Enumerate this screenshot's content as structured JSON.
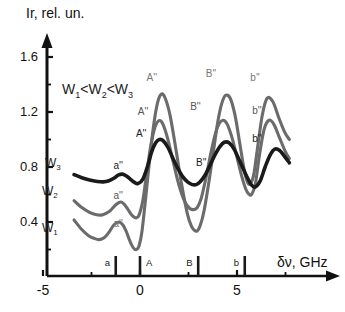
{
  "figure": {
    "ylabel": "Ir, rel. un.",
    "xlabel": "δν, GHz",
    "annotation": {
      "w1": "W",
      "s1": "1",
      "lt1": "<",
      "w2": "W",
      "s2": "2",
      "lt2": "<",
      "w3": "W",
      "s3": "3"
    }
  },
  "axes": {
    "yticks": [
      "0.4",
      "0.8",
      "1.2",
      "1.6"
    ],
    "xticks": [
      "-5",
      "0",
      "5"
    ]
  },
  "curve_labels": [
    {
      "name": "W",
      "sub": "3"
    },
    {
      "name": "W",
      "sub": "2"
    },
    {
      "name": "W",
      "sub": "1"
    }
  ],
  "stick_markers": [
    {
      "label": "a",
      "x": -1.25
    },
    {
      "label": "A",
      "x": 0.0
    },
    {
      "label": "B",
      "x": 3.0
    },
    {
      "label": "b",
      "x": 5.4
    }
  ],
  "peak_labels": [
    {
      "text": "a''",
      "series": "W3",
      "x": -0.95,
      "y": 0.8
    },
    {
      "text": "a''",
      "series": "W2",
      "x": -0.95,
      "y": 0.58
    },
    {
      "text": "a''",
      "series": "W1",
      "x": -0.95,
      "y": 0.38
    },
    {
      "text": "A''",
      "series": "W1",
      "x": 0.75,
      "y": 1.44
    },
    {
      "text": "A''",
      "series": "W2",
      "x": 0.3,
      "y": 1.19
    },
    {
      "text": "A''",
      "series": "W3",
      "x": 0.2,
      "y": 1.03
    },
    {
      "text": "B''",
      "series": "W1",
      "x": 3.8,
      "y": 1.47
    },
    {
      "text": "B''",
      "series": "W2",
      "x": 3.0,
      "y": 1.23
    },
    {
      "text": "B''",
      "series": "W3",
      "x": 3.3,
      "y": 0.82
    },
    {
      "text": "b''",
      "series": "W1",
      "x": 6.1,
      "y": 1.44
    },
    {
      "text": "b''",
      "series": "W2",
      "x": 6.2,
      "y": 1.2
    },
    {
      "text": "b''",
      "series": "W3",
      "x": 6.2,
      "y": 1.0
    }
  ],
  "chart_data": {
    "type": "line",
    "title": "",
    "xlabel": "δν, GHz",
    "ylabel": "Ir, rel. un.",
    "xlim": [
      -5,
      8
    ],
    "ylim": [
      0,
      1.7
    ],
    "yticks": [
      0.4,
      0.8,
      1.2,
      1.6
    ],
    "xticks": [
      -5,
      0,
      5
    ],
    "grid": false,
    "legend": "inline-curve-labels",
    "annotations": [
      "W1<W2<W3"
    ],
    "colors": {
      "W3": "#1a1a1a",
      "W2": "#6b6b6b",
      "W1": "#6b6b6b"
    },
    "series": [
      {
        "name": "W3",
        "color": "#1a1a1a",
        "x": [
          -3.4,
          -3.0,
          -2.6,
          -2.2,
          -1.9,
          -1.6,
          -1.35,
          -1.1,
          -0.9,
          -0.7,
          -0.5,
          -0.3,
          -0.1,
          0.15,
          0.4,
          0.6,
          0.8,
          1.0,
          1.2,
          1.45,
          1.7,
          1.95,
          2.2,
          2.45,
          2.7,
          2.9,
          3.1,
          3.35,
          3.6,
          3.85,
          4.1,
          4.35,
          4.6,
          4.85,
          5.1,
          5.35,
          5.55,
          5.75,
          5.95,
          6.2,
          6.45,
          6.7,
          6.95,
          7.2,
          7.45,
          7.7
        ],
        "y": [
          0.745,
          0.722,
          0.705,
          0.695,
          0.692,
          0.7,
          0.718,
          0.742,
          0.748,
          0.735,
          0.712,
          0.69,
          0.68,
          0.712,
          0.81,
          0.91,
          0.975,
          1.0,
          0.99,
          0.94,
          0.862,
          0.79,
          0.73,
          0.692,
          0.672,
          0.672,
          0.692,
          0.74,
          0.81,
          0.885,
          0.945,
          0.98,
          0.975,
          0.93,
          0.855,
          0.778,
          0.718,
          0.668,
          0.655,
          0.7,
          0.8,
          0.885,
          0.93,
          0.92,
          0.878,
          0.83
        ]
      },
      {
        "name": "W2",
        "color": "#6b6b6b",
        "x": [
          -3.4,
          -3.0,
          -2.6,
          -2.3,
          -2.0,
          -1.75,
          -1.5,
          -1.25,
          -1.0,
          -0.82,
          -0.65,
          -0.5,
          -0.35,
          -0.2,
          -0.05,
          0.15,
          0.35,
          0.55,
          0.75,
          0.95,
          1.15,
          1.4,
          1.7,
          2.0,
          2.3,
          2.55,
          2.75,
          2.95,
          3.15,
          3.4,
          3.65,
          3.9,
          4.1,
          4.3,
          4.5,
          4.75,
          5.0,
          5.25,
          5.45,
          5.6,
          5.75,
          5.95,
          6.15,
          6.4,
          6.65,
          6.9,
          7.2,
          7.5,
          7.7
        ],
        "y": [
          0.555,
          0.505,
          0.47,
          0.455,
          0.45,
          0.462,
          0.487,
          0.525,
          0.545,
          0.53,
          0.498,
          0.465,
          0.44,
          0.43,
          0.45,
          0.56,
          0.76,
          0.95,
          1.08,
          1.135,
          1.12,
          1.02,
          0.845,
          0.672,
          0.55,
          0.5,
          0.49,
          0.505,
          0.57,
          0.72,
          0.9,
          1.05,
          1.12,
          1.14,
          1.11,
          1.01,
          0.87,
          0.73,
          0.64,
          0.605,
          0.6,
          0.68,
          0.88,
          1.075,
          1.14,
          1.11,
          1.01,
          0.91,
          0.862
        ]
      },
      {
        "name": "W1",
        "color": "#6b6b6b",
        "x": [
          -3.4,
          -3.0,
          -2.65,
          -2.35,
          -2.1,
          -1.85,
          -1.6,
          -1.35,
          -1.1,
          -0.9,
          -0.72,
          -0.55,
          -0.42,
          -0.3,
          -0.18,
          -0.05,
          0.1,
          0.3,
          0.5,
          0.7,
          0.9,
          1.1,
          1.3,
          1.55,
          1.85,
          2.15,
          2.45,
          2.65,
          2.8,
          2.95,
          3.1,
          3.3,
          3.55,
          3.8,
          4.0,
          4.2,
          4.4,
          4.65,
          4.9,
          5.15,
          5.35,
          5.5,
          5.65,
          5.85,
          6.05,
          6.3,
          6.55,
          6.85,
          7.15,
          7.45,
          7.7
        ],
        "y": [
          0.415,
          0.345,
          0.3,
          0.28,
          0.272,
          0.285,
          0.325,
          0.378,
          0.4,
          0.382,
          0.335,
          0.272,
          0.23,
          0.205,
          0.2,
          0.225,
          0.33,
          0.585,
          0.86,
          1.1,
          1.265,
          1.33,
          1.3,
          1.175,
          0.93,
          0.67,
          0.455,
          0.37,
          0.34,
          0.335,
          0.372,
          0.48,
          0.69,
          0.93,
          1.12,
          1.255,
          1.32,
          1.3,
          1.175,
          0.965,
          0.795,
          0.705,
          0.675,
          0.735,
          0.93,
          1.175,
          1.3,
          1.275,
          1.16,
          1.055,
          1.0
        ]
      }
    ]
  }
}
